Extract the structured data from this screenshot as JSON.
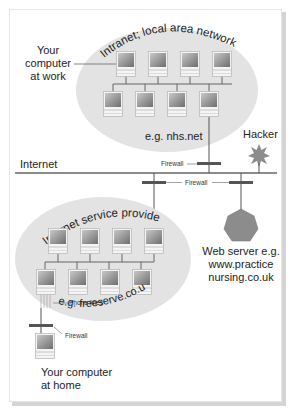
{
  "diagram": {
    "intranet": {
      "title": "Intranet; local area network",
      "example": "e.g. nhs.net",
      "work_label_line1": "Your",
      "work_label_line2": "computer",
      "work_label_line3": "at work"
    },
    "internet_label": "Internet",
    "hacker_label": "Hacker",
    "firewall_label": "Firewall",
    "isp": {
      "title": "Internet service provider",
      "example": "e.g. freeserve.co.uk",
      "phone_lines_label": "Phone lines"
    },
    "web_server": {
      "line1": "Web server e.g.",
      "line2": "www.practice",
      "line3": "nursing.co.uk"
    },
    "home": {
      "line1": "Your computer",
      "line2": "at home"
    },
    "colors": {
      "cloud": "#e3e3e3",
      "line": "#555555",
      "firewall": "#555555",
      "hacker": "#8c8c8c",
      "server": "#8c8c8c"
    }
  }
}
